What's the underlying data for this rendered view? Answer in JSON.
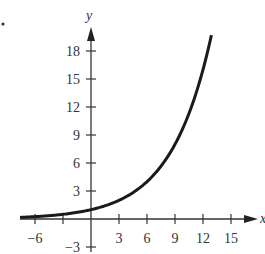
{
  "bullet": "•",
  "chart_data": {
    "type": "line",
    "title": "",
    "xlabel": "x",
    "ylabel": "y",
    "function": "y = 2^(x/3)",
    "xlim": [
      -7.6,
      12.9
    ],
    "ylim": [
      -3,
      19.5
    ],
    "grid": false,
    "legend": null,
    "x_ticks": [
      -6,
      -3,
      3,
      6,
      9,
      12,
      15
    ],
    "x_tick_labels": [
      "−6",
      "3",
      "6",
      "9",
      "12",
      "15"
    ],
    "y_ticks": [
      -3,
      3,
      6,
      9,
      12,
      15,
      18
    ],
    "y_tick_labels": [
      "−3",
      "3",
      "6",
      "9",
      "12",
      "15",
      "18"
    ],
    "series": [
      {
        "name": "exponential curve",
        "x": [
          -7.6,
          -6,
          -3,
          0,
          3,
          6,
          9,
          12,
          12.9
        ],
        "y": [
          0.17,
          0.25,
          0.5,
          1,
          2,
          4,
          8,
          16,
          19.7
        ]
      }
    ],
    "curve_color": "#1a1a1a",
    "axis_color": "#333333"
  },
  "axes": {
    "x_label": "x",
    "y_label": "y",
    "x_tick_labels": [
      {
        "value": -6,
        "text": "−6"
      },
      {
        "value": 3,
        "text": "3"
      },
      {
        "value": 6,
        "text": "6"
      },
      {
        "value": 9,
        "text": "9"
      },
      {
        "value": 12,
        "text": "12"
      },
      {
        "value": 15,
        "text": "15"
      }
    ],
    "y_tick_labels": [
      {
        "value": 18,
        "text": "18"
      },
      {
        "value": 15,
        "text": "15"
      },
      {
        "value": 12,
        "text": "12"
      },
      {
        "value": 9,
        "text": "9"
      },
      {
        "value": 6,
        "text": "6"
      },
      {
        "value": 3,
        "text": "3"
      },
      {
        "value": -3,
        "text": "−3"
      }
    ]
  }
}
